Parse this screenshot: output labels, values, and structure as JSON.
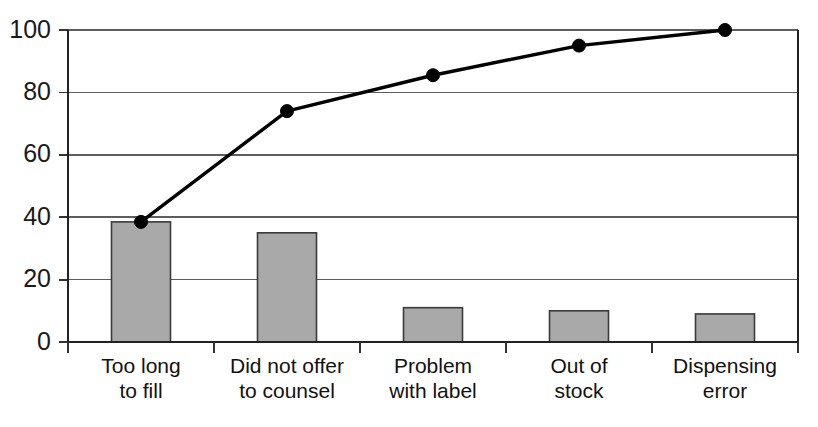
{
  "chart_data": {
    "type": "bar",
    "title": "",
    "subtitle": "",
    "xlabel": "",
    "ylabel": "",
    "ylim": [
      0,
      100
    ],
    "grid": true,
    "legend": "none",
    "categories": [
      "Too long\nto fill",
      "Did not offer\nto counsel",
      "Problem\nwith label",
      "Out of\nstock",
      "Dispensing\nerror"
    ],
    "category_lines": [
      [
        "Too long",
        "to fill"
      ],
      [
        "Did not offer",
        "to counsel"
      ],
      [
        "Problem",
        "with label"
      ],
      [
        "Out of",
        "stock"
      ],
      [
        "Dispensing",
        "error"
      ]
    ],
    "values": [
      38.5,
      35,
      11,
      10,
      9
    ],
    "ytick_labels": [
      "0",
      "20",
      "40",
      "60",
      "80",
      "100"
    ],
    "ytick_values": [
      0,
      20,
      40,
      60,
      80,
      100
    ],
    "series": [
      {
        "name": "Frequency",
        "type": "bar",
        "values": [
          38.5,
          35,
          11,
          10,
          9
        ]
      },
      {
        "name": "Cumulative percentage",
        "type": "line",
        "values": [
          38.5,
          74,
          85.5,
          95,
          100
        ]
      }
    ],
    "colors": {
      "bar_fill": "#a9a9a9",
      "bar_edge": "#3a3a3a",
      "line": "#000000",
      "marker": "#000000",
      "gridline": "#5d5d5d",
      "axis": "#222222",
      "text": "#1a1a1a",
      "background": "#ffffff"
    }
  }
}
